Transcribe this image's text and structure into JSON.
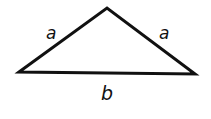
{
  "diagram": {
    "type": "isosceles-triangle",
    "vertices": {
      "left": [
        19,
        72
      ],
      "apex": [
        107,
        8
      ],
      "right": [
        195,
        74
      ]
    },
    "labels": {
      "left_side": "a",
      "right_side": "a",
      "base": "b"
    },
    "stroke_color": "#111111",
    "background": "#ffffff"
  }
}
